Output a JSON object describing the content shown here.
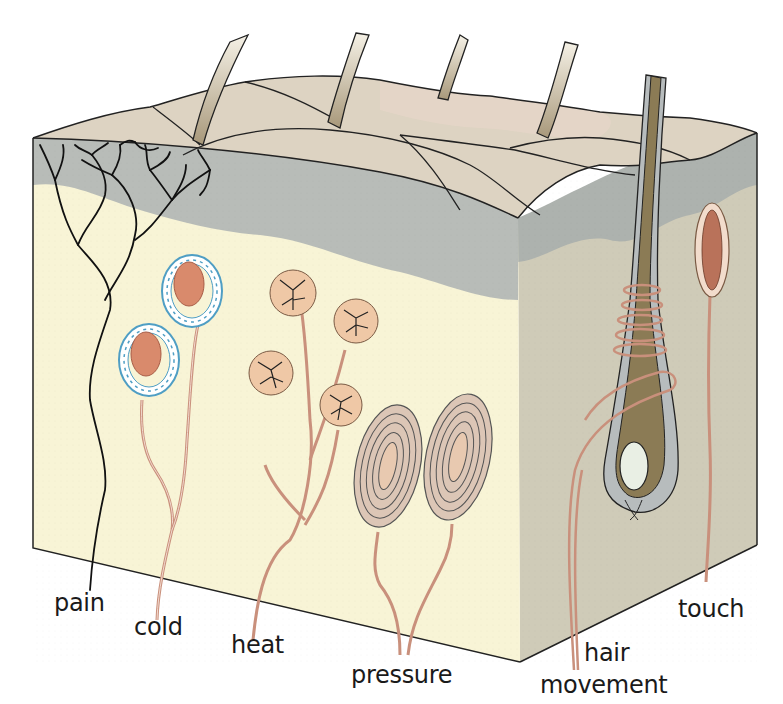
{
  "diagram": {
    "colors": {
      "epidermis_top": "#ddd3c2",
      "epidermis_pink": "#e6d6c8",
      "epidermis_layer": "#b8bcb8",
      "dermis_front": "#f8f4d6",
      "dermis_side": "#cfcbb8",
      "nerve": "#c9907c",
      "pain_nerve": "#111111",
      "receptor_fill": "#efc8a6",
      "bulb_fill": "#d98a6c",
      "cold_capsule": "#4f9ec4",
      "follicle": "#8b7b55"
    },
    "labels": [
      {
        "id": "pain",
        "text": "pain"
      },
      {
        "id": "cold",
        "text": "cold"
      },
      {
        "id": "heat",
        "text": "heat"
      },
      {
        "id": "pressure",
        "text": "pressure"
      },
      {
        "id": "hair_movement_1",
        "text": "hair"
      },
      {
        "id": "hair_movement_2",
        "text": "movement"
      },
      {
        "id": "touch",
        "text": "touch"
      }
    ]
  }
}
